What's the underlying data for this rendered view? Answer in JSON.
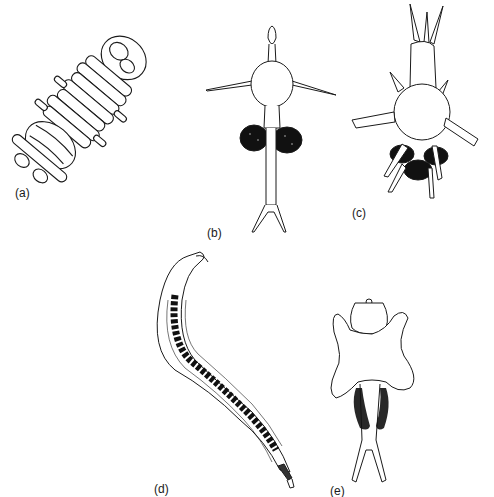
{
  "figure": {
    "panels": [
      {
        "id": "a",
        "label": "(a)",
        "description": "coiled segmented larva"
      },
      {
        "id": "b",
        "label": "(b)",
        "description": "larva with lateral spines and paired dark egg sacs"
      },
      {
        "id": "c",
        "label": "(c)",
        "description": "spiny larva with forked anterior and dark posterior mass"
      },
      {
        "id": "d",
        "label": "(d)",
        "description": "elongated curved worm with dark internal gut"
      },
      {
        "id": "e",
        "label": "(e)",
        "description": "flattened lobed larva with paired dark stippled sacs and forked tail"
      }
    ],
    "colors": {
      "background": "#ffffff",
      "ink": "#1a1a1a",
      "dark_fill": "#111111"
    }
  }
}
